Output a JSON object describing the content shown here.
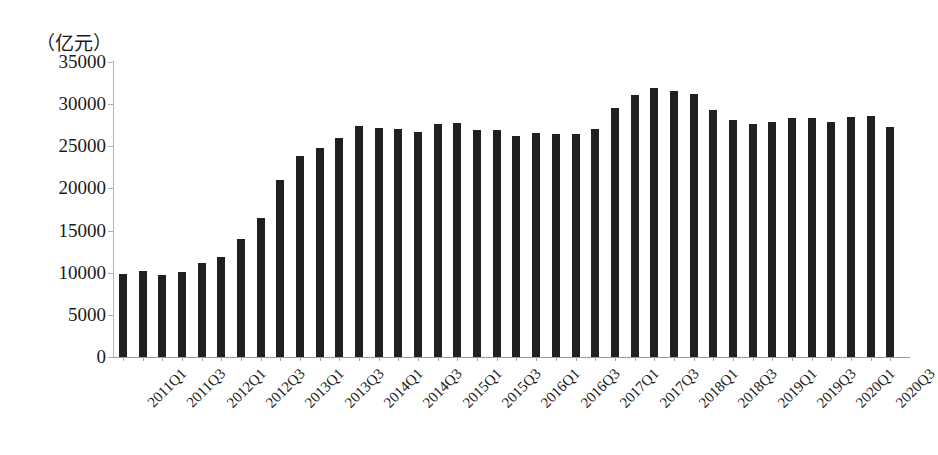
{
  "chart_data": {
    "type": "bar",
    "title": "",
    "subtitle": "",
    "unit_label": "（亿元）",
    "xlabel": "",
    "ylabel": "",
    "ylim": [
      0,
      35000
    ],
    "ytick_step": 5000,
    "ytick_labels": [
      "35000",
      "30000",
      "25000",
      "20000",
      "15000",
      "10000",
      "5000",
      "0"
    ],
    "ytick_values": [
      35000,
      30000,
      25000,
      20000,
      15000,
      10000,
      5000,
      0
    ],
    "grid": false,
    "legend": null,
    "bar_color": "#231f20",
    "axis_color": "#b0b0b0",
    "categories": [
      "2011Q1",
      "2011Q2",
      "2011Q3",
      "2011Q4",
      "2012Q1",
      "2012Q2",
      "2012Q3",
      "2012Q4",
      "2013Q1",
      "2013Q2",
      "2013Q3",
      "2013Q4",
      "2014Q1",
      "2014Q2",
      "2014Q3",
      "2014Q4",
      "2015Q1",
      "2015Q2",
      "2015Q3",
      "2015Q4",
      "2016Q1",
      "2016Q2",
      "2016Q3",
      "2016Q4",
      "2017Q1",
      "2017Q2",
      "2017Q3",
      "2017Q4",
      "2018Q1",
      "2018Q2",
      "2018Q3",
      "2018Q4",
      "2019Q1",
      "2019Q2",
      "2019Q3",
      "2019Q4",
      "2020Q1",
      "2020Q2",
      "2020Q3",
      "2020Q4"
    ],
    "visible_xtick_labels": [
      "2011Q1",
      "",
      "2011Q3",
      "",
      "2012Q1",
      "",
      "2012Q3",
      "",
      "2013Q1",
      "",
      "2013Q3",
      "",
      "2014Q1",
      "",
      "2014Q3",
      "",
      "2015Q1",
      "",
      "2015Q3",
      "",
      "2016Q1",
      "",
      "2016Q3",
      "",
      "2017Q1",
      "",
      "2017Q3",
      "",
      "2018Q1",
      "",
      "2018Q3",
      "",
      "2019Q1",
      "",
      "2019Q3",
      "",
      "2020Q1",
      "",
      "2020Q3",
      ""
    ],
    "values": [
      9900,
      10200,
      9700,
      10100,
      11200,
      11900,
      14000,
      16500,
      21000,
      23900,
      24800,
      26000,
      27400,
      27200,
      27100,
      26700,
      27600,
      27800,
      26900,
      26900,
      26200,
      26600,
      26500,
      26500,
      27100,
      29500,
      31100,
      31900,
      31600,
      31200,
      29300,
      28100,
      27600,
      27900,
      28300,
      28400,
      27900,
      28500,
      28600,
      27300
    ],
    "last_value": 24300
  }
}
